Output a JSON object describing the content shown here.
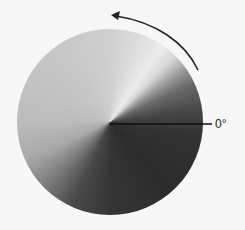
{
  "diagram": {
    "type": "conic-gradient-disc",
    "zero_label": "0°",
    "arrow_direction": "counterclockwise",
    "colors": {
      "line": "#111111",
      "arrow": "#222222",
      "background": "#f7f7f7"
    }
  }
}
